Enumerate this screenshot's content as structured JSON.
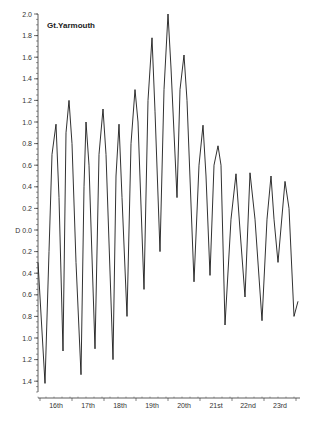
{
  "chart_data": {
    "type": "line",
    "title": "Gt.Yarmouth",
    "xlabel": "",
    "ylabel": "D",
    "y_axis_note": "Values above datum D are positive, values below datum are shown on reversed scale (labels 0.2..1.4 below D)",
    "y_ticks_above": [
      "2.0",
      "1.8",
      "1.6",
      "1.4",
      "1.2",
      "1.0",
      "0.8",
      "0.6",
      "0.4",
      "0.2"
    ],
    "y_datum_label": "D 0.0",
    "y_ticks_below": [
      "0.2",
      "0.4",
      "0.6",
      "0.8",
      "1.0",
      "1.2",
      "1.4"
    ],
    "ylim": [
      -1.5,
      2.0
    ],
    "x_categories": [
      "16th",
      "17th",
      "18th",
      "19th",
      "20th",
      "21st",
      "22nd",
      "23rd"
    ],
    "grid": false,
    "legend": "none",
    "series": [
      {
        "name": "Gt.Yarmouth water level",
        "points": [
          [
            38,
            -0.3
          ],
          [
            45,
            -1.42
          ],
          [
            49,
            -0.2
          ],
          [
            52,
            0.7
          ],
          [
            56,
            0.98
          ],
          [
            59,
            0.3
          ],
          [
            63,
            -1.12
          ],
          [
            66,
            0.9
          ],
          [
            69,
            1.2
          ],
          [
            72,
            0.8
          ],
          [
            76,
            -0.3
          ],
          [
            81,
            -1.34
          ],
          [
            84,
            0.4
          ],
          [
            86,
            1.0
          ],
          [
            89,
            0.6
          ],
          [
            95,
            -1.1
          ],
          [
            99,
            0.7
          ],
          [
            103,
            1.12
          ],
          [
            106,
            0.7
          ],
          [
            113,
            -1.2
          ],
          [
            116,
            0.5
          ],
          [
            119,
            0.98
          ],
          [
            122,
            0.3
          ],
          [
            127,
            -0.8
          ],
          [
            131,
            0.8
          ],
          [
            135,
            1.3
          ],
          [
            138,
            1.0
          ],
          [
            144,
            -0.55
          ],
          [
            148,
            1.2
          ],
          [
            152,
            1.78
          ],
          [
            155,
            1.1
          ],
          [
            160,
            -0.2
          ],
          [
            164,
            1.3
          ],
          [
            168,
            2.0
          ],
          [
            171,
            1.5
          ],
          [
            177,
            0.3
          ],
          [
            180,
            1.3
          ],
          [
            184,
            1.62
          ],
          [
            187,
            1.2
          ],
          [
            194,
            -0.48
          ],
          [
            199,
            0.6
          ],
          [
            203,
            0.97
          ],
          [
            206,
            0.5
          ],
          [
            210,
            -0.42
          ],
          [
            214,
            0.6
          ],
          [
            218,
            0.78
          ],
          [
            221,
            0.6
          ],
          [
            225,
            -0.88
          ],
          [
            231,
            0.1
          ],
          [
            236,
            0.52
          ],
          [
            240,
            0.0
          ],
          [
            245,
            -0.62
          ],
          [
            250,
            0.53
          ],
          [
            255,
            0.1
          ],
          [
            262,
            -0.84
          ],
          [
            267,
            0.1
          ],
          [
            271,
            0.5
          ],
          [
            274,
            0.1
          ],
          [
            278,
            -0.3
          ],
          [
            285,
            0.45
          ],
          [
            289,
            0.2
          ],
          [
            294,
            -0.8
          ],
          [
            298,
            -0.66
          ]
        ]
      }
    ]
  },
  "colors": {
    "line": "#1a1a1a",
    "axis": "#333333",
    "background": "#ffffff"
  }
}
